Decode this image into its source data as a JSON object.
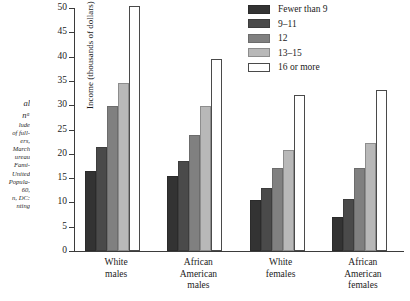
{
  "chart_data": {
    "type": "bar",
    "title": "",
    "xlabel": "",
    "ylabel": "Income (thousands of dollars)",
    "ylim": [
      0,
      50
    ],
    "ytick_step": 5,
    "ytick_labels": [
      "0",
      "5",
      "10",
      "15",
      "20",
      "25",
      "30",
      "35",
      "40",
      "45",
      "50"
    ],
    "grid": false,
    "legend_position": "top-right",
    "legend_title": "",
    "categories": [
      "White males",
      "African American males",
      "White females",
      "African American females"
    ],
    "series": [
      {
        "name": "Fewer than 9",
        "color": "#333333",
        "values": [
          16.5,
          15.5,
          10.5,
          7.0
        ]
      },
      {
        "name": "9–11",
        "color": "#4a4a4a",
        "values": [
          21.5,
          18.5,
          13.0,
          10.8
        ]
      },
      {
        "name": "12",
        "color": "#808080",
        "values": [
          29.8,
          23.8,
          17.0,
          17.0
        ]
      },
      {
        "name": "13–15",
        "color": "#b8b8b8",
        "values": [
          34.5,
          29.8,
          20.8,
          22.2
        ]
      },
      {
        "name": "16 or more",
        "color": "#ffffff",
        "values": [
          50.5,
          39.5,
          32.0,
          33.2
        ]
      }
    ]
  },
  "legend": {
    "items": [
      {
        "label": "Fewer than 9"
      },
      {
        "label": "9–11"
      },
      {
        "label": "12"
      },
      {
        "label": "13–15"
      },
      {
        "label": "16 or more"
      }
    ]
  },
  "axes": {
    "y_title": "Income (thousands of dollars)",
    "y_ticks": [
      "50",
      "45",
      "40",
      "35",
      "30",
      "25",
      "20",
      "15",
      "10",
      "5",
      "0"
    ]
  },
  "x_categories": [
    {
      "lines": [
        "White",
        "males"
      ]
    },
    {
      "lines": [
        "African",
        "American",
        "males"
      ]
    },
    {
      "lines": [
        "White",
        "females"
      ]
    },
    {
      "lines": [
        "African",
        "American",
        "females"
      ]
    }
  ],
  "caption_fragments": {
    "lines": [
      {
        "text": "al",
        "style": "a"
      },
      {
        "text": "nᵃ",
        "style": "b"
      },
      {
        "text": "lude",
        "style": "s"
      },
      {
        "text": "of full-",
        "style": "s"
      },
      {
        "text": "ers,",
        "style": "s"
      },
      {
        "text": "March",
        "style": "s"
      },
      {
        "text": "ureau",
        "style": "s"
      },
      {
        "text": "Fami-",
        "style": "s"
      },
      {
        "text": "United",
        "style": "s"
      },
      {
        "text": "Popula-",
        "style": "s"
      },
      {
        "text": "60,",
        "style": "s"
      },
      {
        "text": "n, DC:",
        "style": "s"
      },
      {
        "text": "nting",
        "style": "s"
      }
    ]
  }
}
